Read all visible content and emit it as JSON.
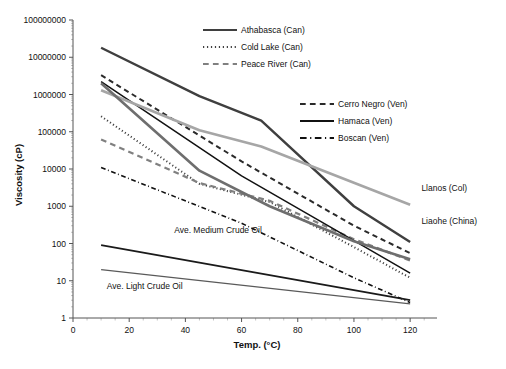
{
  "chart_data": {
    "type": "line",
    "title": "",
    "xlabel": "Temp. (°C)",
    "ylabel": "Viscosity (cP)",
    "xlim": [
      0,
      126
    ],
    "ylim": [
      1,
      100000000
    ],
    "yscale": "log",
    "grid": false,
    "xticks": [
      0,
      20,
      40,
      60,
      80,
      100,
      120
    ],
    "xtick_labels": [
      "0",
      "20",
      "40",
      "60",
      "80",
      "100",
      "120"
    ],
    "yticks": [
      1,
      10,
      100,
      1000,
      10000,
      100000,
      1000000,
      10000000,
      100000000
    ],
    "ytick_labels": [
      "1",
      "10",
      "100",
      "1000",
      "10000",
      "100000",
      "1000000",
      "10000000",
      "100000000"
    ],
    "legend_position": "inside-upper-right",
    "series": [
      {
        "name": "Athabasca (Can)",
        "label": "Athabasca (Can)",
        "style": "solid",
        "color": "#3f3f3f",
        "width": 2.4,
        "legend": "legend_1",
        "x": [
          10,
          45,
          67,
          100,
          120
        ],
        "y": [
          18000000,
          900000,
          200000,
          1000,
          110
        ]
      },
      {
        "name": "Cold Lake (Can)",
        "label": "Cold Lake (Can)",
        "style": "dotted",
        "color": "#3f3f3f",
        "width": 2.0,
        "legend": "legend_1",
        "x": [
          10,
          45,
          70,
          100,
          120
        ],
        "y": [
          260000,
          4000,
          1300,
          80,
          12
        ]
      },
      {
        "name": "Peace River (Can)",
        "label": "Peace River (Can)",
        "style": "dashed",
        "color": "#808080",
        "width": 2.2,
        "legend": "legend_1",
        "x": [
          10,
          45,
          70,
          100,
          120
        ],
        "y": [
          62000,
          4200,
          1400,
          130,
          35
        ]
      },
      {
        "name": "Cerro Negro (Ven)",
        "label": "Cerro Negro (Ven)",
        "style": "dashed",
        "color": "#2a2a2a",
        "width": 2.0,
        "legend": "legend_2",
        "x": [
          10,
          60,
          100,
          120
        ],
        "y": [
          3300000,
          16000,
          300,
          55
        ]
      },
      {
        "name": "Hamaca (Ven)",
        "label": "Hamaca (Ven)",
        "style": "solid",
        "color": "#111111",
        "width": 1.5,
        "legend": "legend_2",
        "x": [
          10,
          60,
          100,
          120
        ],
        "y": [
          2200000,
          6500,
          120,
          16
        ]
      },
      {
        "name": "Boscan (Ven)",
        "label": "Boscan (Ven)",
        "style": "dashdot",
        "color": "#111111",
        "width": 1.6,
        "legend": "legend_2",
        "x": [
          10,
          60,
          100,
          120
        ],
        "y": [
          11000,
          350,
          12,
          2.6
        ]
      },
      {
        "name": "Llanos (Col)",
        "label": "Llanos (Col)",
        "style": "solid",
        "color": "#a6a6a6",
        "width": 2.6,
        "legend": "inline",
        "inline_label_x": 124,
        "inline_label_y": 2600,
        "x": [
          10,
          45,
          67,
          120
        ],
        "y": [
          1300000,
          110000,
          40000,
          1100
        ]
      },
      {
        "name": "Liaohe (China)",
        "label": "Liaohe (China)",
        "style": "solid",
        "color": "#6e6e6e",
        "width": 2.6,
        "legend": "inline",
        "inline_label_x": 124,
        "inline_label_y": 330,
        "x": [
          10,
          45,
          70,
          100,
          120
        ],
        "y": [
          2000000,
          9000,
          1000,
          115,
          38
        ]
      },
      {
        "name": "Ave. Medium Crude Oil",
        "label": "Ave. Medium Crude Oil",
        "style": "solid",
        "color": "#1a1a1a",
        "width": 1.8,
        "legend": "inline",
        "inline_label_x": 36,
        "inline_label_y": 190,
        "x": [
          10,
          120
        ],
        "y": [
          90,
          3.0
        ]
      },
      {
        "name": "Ave. Light Crude Oil",
        "label": "Ave. Light Crude Oil",
        "style": "solid",
        "color": "#5a5a5a",
        "width": 1.3,
        "legend": "inline",
        "inline_label_x": 12,
        "inline_label_y": 6.0,
        "x": [
          10,
          120
        ],
        "y": [
          20,
          2.4
        ]
      }
    ]
  },
  "legend_1": {
    "items": [
      {
        "label": "Athabasca (Can)",
        "style": "solid",
        "color": "#3f3f3f"
      },
      {
        "label": "Cold Lake (Can)",
        "style": "dotted",
        "color": "#3f3f3f"
      },
      {
        "label": "Peace River (Can)",
        "style": "dashed",
        "color": "#808080"
      }
    ]
  },
  "legend_2": {
    "items": [
      {
        "label": "Cerro Negro (Ven)",
        "style": "dashed",
        "color": "#2a2a2a"
      },
      {
        "label": "Hamaca (Ven)",
        "style": "solid",
        "color": "#111111"
      },
      {
        "label": "Boscan (Ven)",
        "style": "dashdot",
        "color": "#111111"
      }
    ]
  }
}
